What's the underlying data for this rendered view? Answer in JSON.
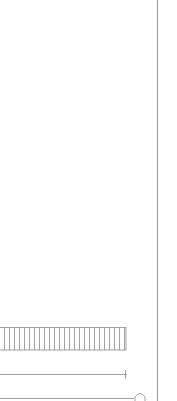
{
  "figure": {
    "type": "line-drawing",
    "background": "#ffffff",
    "stroke_color": "#8a8a8a",
    "elements": {
      "border_line": {
        "x": 157,
        "y1": 0,
        "y2": 401
      },
      "hatched_bar": {
        "x": 0,
        "y": 327,
        "width": 126,
        "height": 23,
        "hatch_spacing": 5
      },
      "dimension_line": {
        "x1": 0,
        "x2": 127,
        "y": 374,
        "tick_x": 125
      },
      "base_line": {
        "x1": 0,
        "x2": 134,
        "y": 398,
        "arc_x": 140
      }
    }
  }
}
